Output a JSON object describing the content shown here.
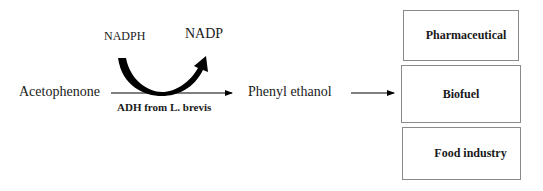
{
  "diagram": {
    "substrate": "Acetophenone",
    "product": "Phenyl ethanol",
    "cofactor_in": "NADPH",
    "cofactor_out": "NADP",
    "enzyme": "ADH from L. brevis",
    "applications": [
      {
        "label": "Pharmaceutical"
      },
      {
        "label": "Biofuel"
      },
      {
        "label": "Food industry"
      }
    ],
    "colors": {
      "text": "#1a1a1a",
      "box_border": "#8a8a8a",
      "arrow": "#000000"
    }
  }
}
